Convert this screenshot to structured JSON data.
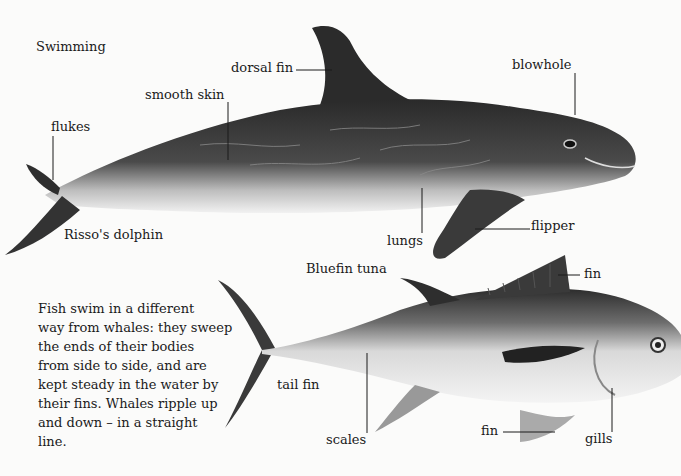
{
  "heading": "Swimming",
  "dolphin": {
    "name": "Risso's dolphin",
    "labels": {
      "dorsal_fin": "dorsal fin",
      "smooth_skin": "smooth skin",
      "flukes": "flukes",
      "blowhole": "blowhole",
      "lungs": "lungs",
      "flipper": "flipper"
    }
  },
  "tuna": {
    "name": "Bluefin tuna",
    "labels": {
      "fin_top": "fin",
      "tail_fin": "tail fin",
      "scales": "scales",
      "fin_bottom": "fin",
      "gills": "gills"
    }
  },
  "paragraph": {
    "lines": [
      "Fish swim in a different",
      "way from whales: they sweep",
      "the ends of their bodies",
      "from side to side, and are",
      "kept steady in the water by",
      "their fins. Whales ripple up",
      "and down – in a straight",
      "line."
    ]
  }
}
